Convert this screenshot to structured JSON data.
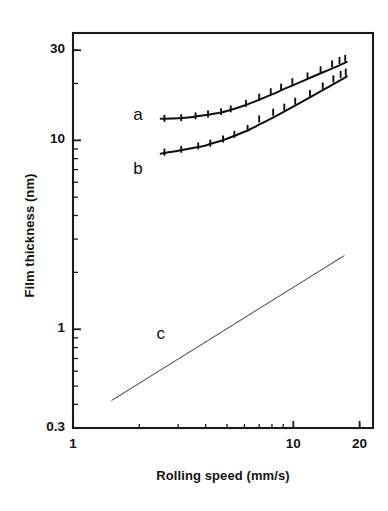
{
  "chart_data": {
    "type": "line",
    "title": "",
    "xlabel": "Rolling speed (mm/s)",
    "ylabel": "Film thickness (nm)",
    "xscale": "log",
    "yscale": "log",
    "xlim": [
      1,
      23
    ],
    "ylim": [
      0.3,
      37
    ],
    "grid": false,
    "legend_position": "inline-curve-labels",
    "xticks": [
      {
        "value": 1,
        "label": "1"
      },
      {
        "value": 10,
        "label": "10"
      },
      {
        "value": 20,
        "label": "20"
      }
    ],
    "yticks": [
      {
        "value": 30,
        "label": "30"
      },
      {
        "value": 10,
        "label": "10"
      },
      {
        "value": 1,
        "label": "1"
      },
      {
        "value": 0.3,
        "label": "0.3"
      }
    ],
    "xminor_ticks": [
      2,
      3,
      4,
      5,
      6,
      7,
      8,
      9,
      20
    ],
    "yminor_ticks": [
      0.4,
      0.5,
      0.6,
      0.7,
      0.8,
      0.9,
      2,
      3,
      4,
      5,
      6,
      7,
      8,
      9,
      20,
      30
    ],
    "series": [
      {
        "name": "a",
        "label": "a",
        "style": "solid-line-with-markers",
        "marker": "cross-tick",
        "fit_points": [
          {
            "x": 2.5,
            "y": 13.0
          },
          {
            "x": 3.0,
            "y": 13.1
          },
          {
            "x": 3.5,
            "y": 13.3
          },
          {
            "x": 4.0,
            "y": 13.6
          },
          {
            "x": 4.5,
            "y": 13.9
          },
          {
            "x": 5.0,
            "y": 14.3
          },
          {
            "x": 6.0,
            "y": 15.3
          },
          {
            "x": 7.0,
            "y": 16.4
          },
          {
            "x": 8.0,
            "y": 17.5
          },
          {
            "x": 9.0,
            "y": 18.6
          },
          {
            "x": 10.0,
            "y": 19.6
          },
          {
            "x": 12.0,
            "y": 21.5
          },
          {
            "x": 14.0,
            "y": 23.2
          },
          {
            "x": 16.0,
            "y": 24.8
          },
          {
            "x": 17.5,
            "y": 26.0
          }
        ],
        "data_points": [
          {
            "x": 2.6,
            "y": 13.0
          },
          {
            "x": 3.1,
            "y": 13.1
          },
          {
            "x": 3.6,
            "y": 13.4
          },
          {
            "x": 4.1,
            "y": 13.7
          },
          {
            "x": 4.7,
            "y": 14.1
          },
          {
            "x": 5.2,
            "y": 14.6
          },
          {
            "x": 6.1,
            "y": 15.6
          },
          {
            "x": 7.0,
            "y": 16.8
          },
          {
            "x": 7.9,
            "y": 18.0
          },
          {
            "x": 8.8,
            "y": 19.0
          },
          {
            "x": 9.9,
            "y": 20.3
          },
          {
            "x": 11.6,
            "y": 21.8
          },
          {
            "x": 13.3,
            "y": 23.5
          },
          {
            "x": 15.0,
            "y": 25.2
          },
          {
            "x": 16.2,
            "y": 26.3
          },
          {
            "x": 17.2,
            "y": 27.0
          }
        ]
      },
      {
        "name": "b",
        "label": "b",
        "style": "solid-line-with-markers",
        "marker": "cross-tick",
        "fit_points": [
          {
            "x": 2.5,
            "y": 8.5
          },
          {
            "x": 3.0,
            "y": 8.8
          },
          {
            "x": 3.5,
            "y": 9.1
          },
          {
            "x": 4.0,
            "y": 9.4
          },
          {
            "x": 4.5,
            "y": 9.8
          },
          {
            "x": 5.0,
            "y": 10.2
          },
          {
            "x": 6.0,
            "y": 11.1
          },
          {
            "x": 7.0,
            "y": 12.1
          },
          {
            "x": 8.0,
            "y": 13.1
          },
          {
            "x": 9.0,
            "y": 14.1
          },
          {
            "x": 10.0,
            "y": 15.1
          },
          {
            "x": 12.0,
            "y": 17.0
          },
          {
            "x": 14.0,
            "y": 18.8
          },
          {
            "x": 16.0,
            "y": 20.5
          },
          {
            "x": 17.5,
            "y": 21.8
          }
        ],
        "data_points": [
          {
            "x": 2.6,
            "y": 8.6
          },
          {
            "x": 3.1,
            "y": 8.9
          },
          {
            "x": 3.7,
            "y": 9.3
          },
          {
            "x": 4.2,
            "y": 9.6
          },
          {
            "x": 4.8,
            "y": 10.1
          },
          {
            "x": 5.4,
            "y": 10.7
          },
          {
            "x": 6.2,
            "y": 11.5
          },
          {
            "x": 7.0,
            "y": 12.9
          },
          {
            "x": 8.1,
            "y": 14.0
          },
          {
            "x": 9.1,
            "y": 14.9
          },
          {
            "x": 10.2,
            "y": 16.0
          },
          {
            "x": 11.9,
            "y": 17.6
          },
          {
            "x": 13.6,
            "y": 19.3
          },
          {
            "x": 15.2,
            "y": 21.0
          },
          {
            "x": 16.4,
            "y": 22.2
          },
          {
            "x": 17.3,
            "y": 22.8
          }
        ]
      },
      {
        "name": "c",
        "label": "c",
        "style": "thin-straight-line",
        "marker": "none",
        "fit_points": [
          {
            "x": 1.5,
            "y": 0.42
          },
          {
            "x": 17.0,
            "y": 2.45
          }
        ],
        "data_points": []
      }
    ],
    "series_label_positions": [
      {
        "name": "a",
        "x": 2.0,
        "y": 13.5
      },
      {
        "name": "b",
        "x": 2.0,
        "y": 7.0
      },
      {
        "name": "c",
        "x": 2.55,
        "y": 0.93
      }
    ],
    "colors": {
      "axis": "#1a1a1a",
      "curve_a": "#0f0f0f",
      "curve_b": "#0f0f0f",
      "line_c": "#3a3a3a",
      "background": "#ffffff"
    }
  }
}
